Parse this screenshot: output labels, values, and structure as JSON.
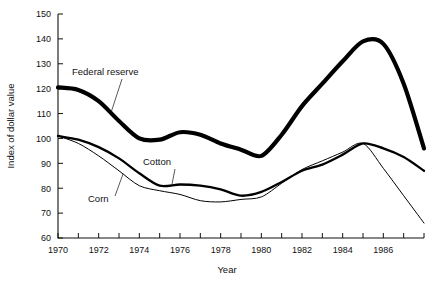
{
  "chart_data": {
    "type": "line",
    "title": "",
    "xlabel": "Year",
    "ylabel": "Index of dollar value",
    "xlim": [
      1970,
      1988
    ],
    "ylim": [
      60,
      150
    ],
    "ytick_step": 10,
    "xtick_step": 1,
    "xticklabel_step": 2,
    "grid": false,
    "legend_position": "inline-annotations",
    "yticks": [
      60,
      70,
      80,
      90,
      100,
      110,
      120,
      130,
      140,
      150
    ],
    "yticklabels": [
      "60",
      "70",
      "80",
      "90",
      "100",
      "110",
      "120",
      "130",
      "140",
      "150"
    ],
    "xticks": [
      1970,
      1971,
      1972,
      1973,
      1974,
      1975,
      1976,
      1977,
      1978,
      1979,
      1980,
      1981,
      1982,
      1983,
      1984,
      1985,
      1986,
      1987,
      1988
    ],
    "xticklabels": [
      "1970",
      "",
      "1972",
      "",
      "1974",
      "",
      "1976",
      "",
      "1978",
      "",
      "1980",
      "",
      "1982",
      "",
      "1984",
      "",
      "1986",
      "",
      ""
    ],
    "x": [
      1970,
      1971,
      1972,
      1973,
      1974,
      1975,
      1976,
      1977,
      1978,
      1979,
      1980,
      1981,
      1982,
      1983,
      1984,
      1985,
      1986,
      1987,
      1988
    ],
    "series": [
      {
        "name": "Federal reserve",
        "label": "Federal reserve",
        "linewidth": "thick",
        "color": "#000000",
        "values": [
          120.5,
          119.5,
          115.0,
          107.0,
          100.0,
          99.5,
          102.5,
          101.5,
          98.0,
          95.5,
          93.0,
          101.5,
          113.0,
          122.0,
          131.0,
          139.0,
          138.0,
          122.0,
          96.0
        ]
      },
      {
        "name": "Cotton",
        "label": "Cotton",
        "linewidth": "medium",
        "color": "#000000",
        "values": [
          101.0,
          99.5,
          96.5,
          92.0,
          86.0,
          81.0,
          81.5,
          81.0,
          79.5,
          77.0,
          78.5,
          82.5,
          87.0,
          89.5,
          93.5,
          98.0,
          96.0,
          92.5,
          87.0
        ]
      },
      {
        "name": "Corn",
        "label": "Corn",
        "linewidth": "thin",
        "color": "#000000",
        "values": [
          101.0,
          98.0,
          93.0,
          87.0,
          81.0,
          79.0,
          77.5,
          75.0,
          74.5,
          75.5,
          76.5,
          82.0,
          87.5,
          91.0,
          94.5,
          98.0,
          88.0,
          77.0,
          66.0
        ]
      }
    ],
    "annotations": [
      {
        "text": "Federal reserve",
        "series": "Federal reserve",
        "anchor_year": 1972.6
      },
      {
        "text": "Cotton",
        "series": "Cotton",
        "anchor_year": 1975.6
      },
      {
        "text": "Corn",
        "series": "Corn",
        "anchor_year": 1973.2
      }
    ]
  },
  "labels": {
    "xlabel": "Year",
    "ylabel": "Index of dollar value",
    "federal_reserve": "Federal reserve",
    "cotton": "Cotton",
    "corn": "Corn"
  }
}
